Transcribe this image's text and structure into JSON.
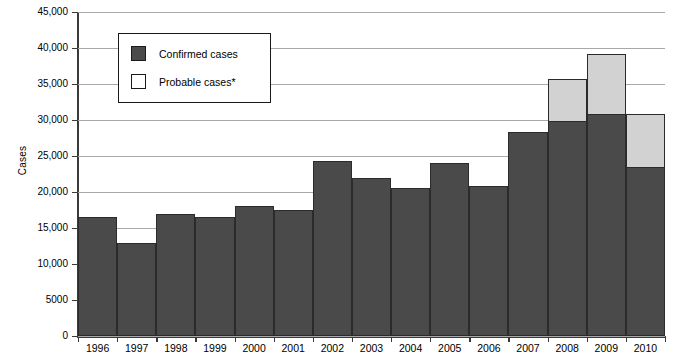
{
  "chart_data": {
    "type": "bar",
    "stacked": true,
    "title": "",
    "xlabel": "",
    "ylabel": "Cases",
    "categories": [
      "1996",
      "1997",
      "1998",
      "1999",
      "2000",
      "2001",
      "2002",
      "2003",
      "2004",
      "2005",
      "2006",
      "2007",
      "2008",
      "2009",
      "2010"
    ],
    "series": [
      {
        "name": "Confirmed cases",
        "color": "#4a4a4a",
        "values": [
          16500,
          12900,
          17000,
          16500,
          18000,
          17500,
          24300,
          21900,
          20500,
          24000,
          20900,
          28300,
          29800,
          30900,
          23500
        ]
      },
      {
        "name": "Probable cases*",
        "color": "#d2d2d2",
        "values": [
          0,
          0,
          0,
          0,
          0,
          0,
          0,
          0,
          0,
          0,
          0,
          0,
          6000,
          8400,
          7500
        ]
      }
    ],
    "totals": [
      16500,
      12900,
      17000,
      16500,
      18000,
      17500,
      24300,
      21900,
      20500,
      24000,
      20900,
      28300,
      35800,
      39300,
      31000
    ],
    "ylim": [
      0,
      45000
    ],
    "yticks": [
      0,
      5000,
      10000,
      15000,
      20000,
      25000,
      30000,
      35000,
      40000,
      45000
    ],
    "ytick_labels": [
      "0",
      "5000",
      "10,000",
      "15,000",
      "20,000",
      "25,000",
      "30,000",
      "35,000",
      "40,000",
      "45,000"
    ],
    "grid": true,
    "legend_position": "top-left"
  },
  "axes": {
    "y_title": "Cases"
  },
  "legend": {
    "entries": [
      {
        "label": "Confirmed cases",
        "swatch": "confirmed"
      },
      {
        "label": "Probable cases*",
        "swatch": "probable"
      }
    ]
  },
  "footnote": {
    "clipped_text": ""
  }
}
